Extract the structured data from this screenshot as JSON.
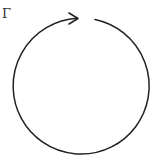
{
  "diagram": {
    "label": "Γ",
    "contour": {
      "shape": "circle",
      "orientation": "clockwise",
      "center": [
        81,
        86
      ],
      "radius": 68,
      "gap": "top",
      "arrow": "right-pointing arrowhead at top",
      "stroke_color": "#222222"
    }
  }
}
